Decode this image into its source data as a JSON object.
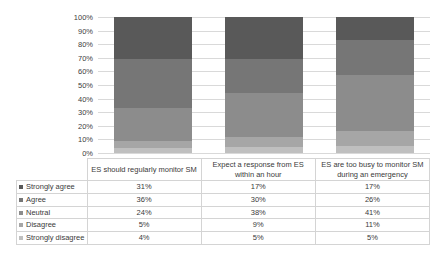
{
  "chart_data": {
    "type": "bar",
    "subtype": "100% stacked column",
    "title": "",
    "xlabel": "",
    "ylabel": "",
    "ylim": [
      0,
      100
    ],
    "ytick_labels": [
      "100%",
      "90%",
      "80%",
      "70%",
      "60%",
      "50%",
      "40%",
      "30%",
      "20%",
      "10%",
      "0%"
    ],
    "ytick_values": [
      100,
      90,
      80,
      70,
      60,
      50,
      40,
      30,
      20,
      10,
      0
    ],
    "grid": true,
    "legend_position": "data-table-left",
    "categories": [
      "ES should regularly monitor SM",
      "Expect a response from ES within an hour",
      "ES are too busy to monitor SM during an emergency"
    ],
    "series": [
      {
        "name": "Strongly agree",
        "values": [
          31,
          36,
          17
        ],
        "color": "#595959",
        "display": [
          "31%",
          "17%",
          "17%"
        ]
      },
      {
        "name": "Agree",
        "values": [
          36,
          30,
          26
        ],
        "color": "#767676",
        "display": [
          "36%",
          "30%",
          "26%"
        ]
      },
      {
        "name": "Neutral",
        "values": [
          24,
          38,
          41
        ],
        "color": "#8c8c8c",
        "display": [
          "24%",
          "38%",
          "41%"
        ]
      },
      {
        "name": "Disagree",
        "values": [
          5,
          9,
          11
        ],
        "color": "#a6a6a6",
        "display": [
          "5%",
          "9%",
          "11%"
        ]
      },
      {
        "name": "Strongly disagree",
        "values": [
          4,
          5,
          5
        ],
        "color": "#bfbfbf",
        "display": [
          "4%",
          "5%",
          "5%"
        ]
      }
    ]
  },
  "axis": {
    "y": {
      "t100": "100%",
      "t90": "90%",
      "t80": "80%",
      "t70": "70%",
      "t60": "60%",
      "t50": "50%",
      "t40": "40%",
      "t30": "30%",
      "t20": "20%",
      "t10": "10%",
      "t0": "0%"
    }
  },
  "table": {
    "category_headers": [
      "ES should regularly monitor SM",
      "Expect a response from ES within an hour",
      "ES are too busy to monitor SM during an emergency"
    ],
    "rows": [
      {
        "label": "Strongly agree",
        "c1": "31%",
        "c2": "17%",
        "c3": "17%"
      },
      {
        "label": "Agree",
        "c1": "36%",
        "c2": "30%",
        "c3": "26%"
      },
      {
        "label": "Neutral",
        "c1": "24%",
        "c2": "38%",
        "c3": "41%"
      },
      {
        "label": "Disagree",
        "c1": "5%",
        "c2": "9%",
        "c3": "11%"
      },
      {
        "label": "Strongly disagree",
        "c1": "4%",
        "c2": "5%",
        "c3": "5%"
      }
    ]
  },
  "colors": {
    "strongly_agree": "#595959",
    "agree": "#767676",
    "neutral": "#8c8c8c",
    "disagree": "#a6a6a6",
    "strongly_disagree": "#bfbfbf",
    "gridline": "#d9d9d9",
    "table_border": "#d4d4d4",
    "text": "#3a3a3a",
    "background": "#ffffff"
  }
}
